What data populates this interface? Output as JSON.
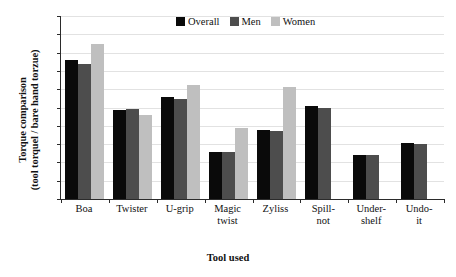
{
  "chart_data": {
    "type": "bar",
    "title": "",
    "xlabel": "Tool used",
    "ylabel_line1": "Torque comparison",
    "ylabel_line2": "(tool torquel / bare hand torzue)",
    "categories": [
      "Boa",
      "Twister",
      "U-grip",
      "Magic twist",
      "Zyliss",
      "Spill-not",
      "Under-shelf",
      "Undo-it"
    ],
    "category_lines": [
      [
        "Boa",
        ""
      ],
      [
        "Twister",
        ""
      ],
      [
        "U-grip",
        ""
      ],
      [
        "Magic",
        "twist"
      ],
      [
        "Zyliss",
        ""
      ],
      [
        "Spill-",
        "not"
      ],
      [
        "Under-",
        "shelf"
      ],
      [
        "Undo-",
        "it"
      ]
    ],
    "series": [
      {
        "name": "Overall",
        "color": "#0a0a0a",
        "values": [
          1.52,
          0.97,
          1.12,
          0.51,
          0.75,
          1.02,
          0.48,
          0.61
        ]
      },
      {
        "name": "Men",
        "color": "#4d4d4d",
        "values": [
          1.48,
          0.98,
          1.09,
          0.51,
          0.74,
          1.0,
          0.48,
          0.6
        ]
      },
      {
        "name": "Women",
        "color": "#bfbfbf",
        "values": [
          1.69,
          0.92,
          1.25,
          0.78,
          1.22,
          null,
          null,
          null
        ]
      }
    ],
    "ylim": [
      0,
      2
    ],
    "yticks": [
      0,
      0.2,
      0.4,
      0.6,
      0.8,
      1,
      1.2,
      1.4,
      1.6,
      1.8,
      2
    ],
    "ytick_labels": [
      "0",
      "0.2",
      "0.4",
      "0.6",
      "0.8",
      "1",
      "1.2",
      "1.4",
      "1.6",
      "1.8",
      "2"
    ],
    "grid": true,
    "legend_position": "top-center"
  },
  "legend": {
    "items": [
      {
        "label": "Overall",
        "color": "#0a0a0a"
      },
      {
        "label": "Men",
        "color": "#4d4d4d"
      },
      {
        "label": "Women",
        "color": "#bfbfbf"
      }
    ]
  }
}
